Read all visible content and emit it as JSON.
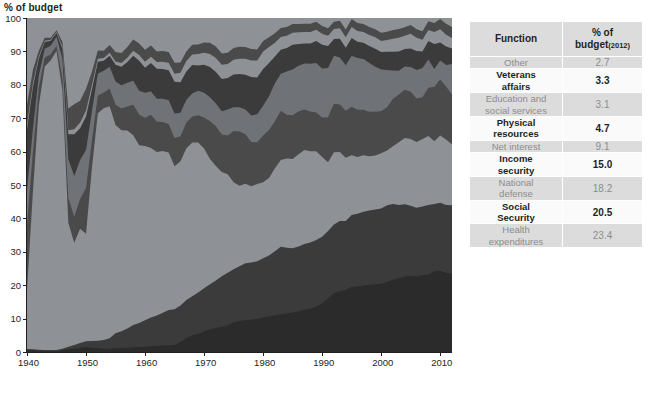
{
  "chart_data": {
    "type": "area",
    "stacked": true,
    "title": "",
    "ylabel": "% of budget",
    "xlabel": "",
    "ylim": [
      0,
      100
    ],
    "xlim": [
      1940,
      2012
    ],
    "grid": false,
    "legend": "table",
    "yticks": [
      0,
      10,
      20,
      30,
      40,
      50,
      60,
      70,
      80,
      90,
      100
    ],
    "xticks": [
      1940,
      1950,
      1960,
      1970,
      1980,
      1990,
      2000,
      2010
    ],
    "x": [
      1940,
      1941,
      1942,
      1943,
      1944,
      1945,
      1946,
      1947,
      1948,
      1949,
      1950,
      1951,
      1952,
      1953,
      1954,
      1955,
      1956,
      1957,
      1958,
      1959,
      1960,
      1961,
      1962,
      1963,
      1964,
      1965,
      1966,
      1967,
      1968,
      1969,
      1970,
      1971,
      1972,
      1973,
      1974,
      1975,
      1976,
      1977,
      1978,
      1979,
      1980,
      1981,
      1982,
      1983,
      1984,
      1985,
      1986,
      1987,
      1988,
      1989,
      1990,
      1991,
      1992,
      1993,
      1994,
      1995,
      1996,
      1997,
      1998,
      1999,
      2000,
      2001,
      2002,
      2003,
      2004,
      2005,
      2006,
      2007,
      2008,
      2009,
      2010,
      2011,
      2012
    ],
    "series": [
      {
        "name": "Health expenditures",
        "value_2012": 23.4,
        "color": "#2b2b2b",
        "values": [
          0.6,
          0.5,
          0.4,
          0.3,
          0.3,
          0.3,
          0.5,
          0.8,
          1.0,
          1.3,
          1.5,
          1.3,
          1.1,
          1.0,
          1.0,
          1.1,
          1.2,
          1.3,
          1.4,
          1.5,
          1.6,
          1.7,
          1.8,
          1.9,
          2.0,
          2.1,
          3.0,
          4.2,
          5.0,
          5.4,
          6.2,
          6.8,
          7.2,
          7.5,
          8.0,
          8.8,
          9.3,
          9.6,
          9.7,
          9.9,
          10.3,
          10.7,
          10.9,
          11.3,
          11.5,
          11.8,
          12.1,
          12.6,
          13.0,
          13.6,
          14.6,
          16.0,
          17.6,
          18.2,
          19.0,
          19.5,
          19.6,
          19.9,
          20.1,
          20.3,
          20.4,
          21.0,
          21.6,
          22.1,
          22.6,
          22.8,
          22.6,
          23.0,
          23.1,
          24.2,
          24.3,
          23.7,
          23.4
        ]
      },
      {
        "name": "Social Security",
        "value_2012": 20.5,
        "color": "#3b3b3b",
        "values": [
          0.3,
          0.3,
          0.3,
          0.3,
          0.3,
          0.3,
          0.5,
          0.8,
          1.1,
          1.4,
          1.7,
          2.0,
          2.3,
          2.6,
          3.1,
          4.5,
          5.0,
          5.7,
          6.7,
          7.2,
          7.9,
          8.6,
          9.1,
          9.7,
          10.3,
          10.7,
          10.9,
          11.4,
          11.7,
          12.4,
          12.9,
          13.5,
          14.2,
          15.2,
          15.7,
          16.0,
          16.4,
          17.0,
          17.1,
          17.3,
          17.8,
          18.2,
          19.3,
          20.2,
          19.7,
          19.3,
          19.5,
          19.7,
          19.8,
          19.9,
          19.9,
          20.2,
          20.6,
          21.0,
          21.0,
          21.5,
          21.8,
          22.1,
          22.3,
          22.4,
          22.6,
          22.9,
          22.7,
          21.9,
          21.6,
          21.0,
          20.6,
          20.6,
          20.9,
          20.1,
          20.4,
          20.3,
          20.5
        ]
      },
      {
        "name": "National defense",
        "value_2012": 18.2,
        "color": "#8e9196",
        "values": [
          17.5,
          47.1,
          73.0,
          84.9,
          86.7,
          89.5,
          77.3,
          37.1,
          30.6,
          34.2,
          32.2,
          51.8,
          68.1,
          69.4,
          69.5,
          62.4,
          60.2,
          59.3,
          56.8,
          53.2,
          52.2,
          50.8,
          49.0,
          48.0,
          46.2,
          42.8,
          43.2,
          45.4,
          46.0,
          44.9,
          41.8,
          37.5,
          34.3,
          31.2,
          29.5,
          26.0,
          24.1,
          23.8,
          22.8,
          23.1,
          22.7,
          23.2,
          24.8,
          26.0,
          26.7,
          26.7,
          27.6,
          28.1,
          27.3,
          26.6,
          23.9,
          20.6,
          21.6,
          20.7,
          19.3,
          17.9,
          17.0,
          16.9,
          16.2,
          16.1,
          16.5,
          16.4,
          17.3,
          18.8,
          19.9,
          20.0,
          19.7,
          20.2,
          20.7,
          18.8,
          20.1,
          19.6,
          18.2
        ]
      },
      {
        "name": "Income security",
        "value_2012": 15.0,
        "color": "#4a4a4a",
        "values": [
          19.6,
          11.9,
          5.4,
          2.7,
          1.8,
          1.6,
          3.5,
          7.5,
          7.8,
          8.9,
          13.7,
          8.3,
          5.2,
          4.7,
          5.2,
          6.0,
          6.5,
          7.2,
          9.1,
          9.2,
          8.4,
          9.9,
          9.0,
          8.6,
          8.4,
          8.5,
          7.5,
          7.7,
          7.8,
          8.2,
          9.3,
          11.3,
          11.9,
          11.2,
          11.6,
          15.4,
          16.2,
          14.8,
          13.3,
          12.5,
          14.0,
          14.4,
          14.1,
          14.7,
          13.1,
          13.1,
          12.8,
          12.1,
          11.9,
          11.6,
          11.8,
          13.5,
          14.5,
          14.2,
          14.4,
          14.5,
          14.1,
          13.6,
          13.3,
          13.1,
          12.6,
          13.0,
          14.2,
          14.3,
          14.4,
          14.1,
          13.0,
          12.5,
          14.4,
          16.3,
          16.8,
          15.9,
          15.0
        ]
      },
      {
        "name": "Net interest",
        "value_2012": 9.1,
        "color": "#6f7276",
        "values": [
          10.5,
          7.0,
          3.7,
          2.6,
          2.6,
          2.7,
          6.0,
          11.5,
          12.2,
          11.7,
          11.4,
          8.7,
          6.7,
          6.5,
          6.6,
          7.0,
          7.0,
          7.1,
          7.2,
          7.1,
          7.5,
          7.0,
          6.9,
          6.9,
          7.0,
          7.3,
          7.0,
          6.8,
          6.9,
          7.3,
          7.4,
          7.2,
          6.8,
          7.0,
          7.8,
          7.1,
          7.3,
          7.4,
          7.9,
          8.4,
          8.9,
          10.1,
          11.4,
          11.1,
          13.0,
          13.7,
          13.7,
          13.8,
          14.3,
          14.8,
          14.7,
          14.7,
          14.4,
          14.1,
          13.9,
          15.3,
          15.5,
          15.2,
          14.6,
          13.5,
          12.5,
          11.1,
          8.5,
          7.1,
          7.0,
          7.4,
          8.5,
          8.7,
          8.5,
          5.3,
          5.7,
          6.4,
          9.1
        ]
      },
      {
        "name": "Physical resources",
        "value_2012": 4.7,
        "color": "#3b3b3b",
        "values": [
          18.0,
          12.5,
          5.0,
          2.0,
          1.5,
          1.1,
          3.0,
          7.5,
          12.5,
          9.5,
          10.0,
          6.5,
          3.5,
          3.0,
          3.3,
          5.0,
          5.5,
          6.2,
          7.5,
          9.0,
          7.5,
          8.5,
          9.0,
          8.8,
          8.8,
          9.5,
          9.2,
          8.5,
          8.5,
          7.6,
          8.4,
          9.0,
          9.4,
          9.6,
          9.4,
          9.8,
          9.9,
          10.4,
          11.5,
          11.0,
          11.0,
          9.9,
          8.0,
          7.2,
          7.0,
          7.4,
          6.5,
          6.0,
          6.1,
          6.6,
          7.1,
          6.6,
          5.0,
          5.6,
          5.3,
          5.3,
          4.9,
          4.9,
          5.1,
          5.4,
          5.2,
          5.5,
          5.6,
          5.8,
          5.2,
          5.6,
          5.7,
          5.0,
          5.5,
          7.5,
          5.4,
          5.6,
          4.7
        ]
      },
      {
        "name": "Education and social services",
        "value_2012": 3.1,
        "color": "#8e9196",
        "values": [
          1.5,
          1.1,
          0.6,
          0.4,
          0.3,
          0.3,
          0.6,
          1.2,
          1.5,
          1.7,
          1.8,
          1.3,
          0.9,
          0.8,
          0.9,
          1.0,
          1.1,
          1.3,
          1.5,
          1.7,
          1.8,
          1.9,
          2.0,
          2.1,
          2.2,
          2.4,
          2.8,
          3.1,
          3.2,
          3.4,
          3.6,
          3.9,
          4.2,
          4.3,
          4.2,
          4.4,
          4.6,
          4.8,
          5.0,
          5.1,
          5.3,
          4.8,
          4.1,
          3.8,
          3.7,
          3.6,
          3.5,
          3.4,
          3.4,
          3.4,
          3.3,
          3.1,
          3.0,
          3.1,
          3.2,
          3.3,
          3.2,
          3.2,
          3.3,
          3.4,
          3.3,
          3.5,
          3.9,
          4.1,
          4.0,
          4.4,
          4.0,
          3.5,
          3.3,
          3.6,
          3.9,
          3.5,
          3.1
        ]
      },
      {
        "name": "Veterans affairs",
        "value_2012": 3.3,
        "color": "#4a4a4a",
        "values": [
          6.0,
          4.0,
          1.8,
          0.9,
          0.6,
          0.5,
          1.5,
          6.5,
          7.5,
          6.5,
          6.5,
          4.0,
          2.5,
          2.2,
          2.3,
          2.8,
          3.0,
          3.2,
          3.4,
          3.5,
          3.6,
          3.4,
          3.2,
          3.2,
          3.1,
          3.3,
          3.1,
          2.9,
          2.9,
          2.9,
          3.1,
          3.4,
          3.5,
          3.4,
          3.4,
          3.5,
          3.6,
          3.5,
          3.4,
          3.3,
          3.1,
          2.9,
          2.8,
          2.7,
          2.6,
          2.6,
          2.5,
          2.5,
          2.5,
          2.4,
          2.3,
          2.2,
          2.2,
          2.3,
          2.4,
          2.4,
          2.4,
          2.4,
          2.4,
          2.4,
          2.5,
          2.5,
          2.6,
          2.6,
          2.5,
          2.6,
          2.5,
          2.5,
          2.6,
          2.7,
          3.1,
          3.3,
          3.3
        ]
      },
      {
        "name": "Other",
        "value_2012": 2.7,
        "color": "#8e9196",
        "values": [
          26.0,
          15.6,
          9.8,
          5.9,
          5.9,
          3.7,
          7.1,
          27.1,
          25.8,
          24.8,
          21.2,
          16.1,
          9.7,
          9.8,
          8.1,
          10.2,
          10.5,
          8.7,
          6.4,
          7.6,
          9.5,
          8.2,
          10.0,
          9.8,
          10.0,
          13.4,
          13.3,
          10.0,
          8.0,
          7.9,
          7.3,
          7.4,
          8.5,
          10.6,
          10.4,
          9.0,
          8.6,
          8.7,
          9.3,
          9.4,
          6.9,
          5.8,
          4.6,
          3.0,
          2.7,
          1.8,
          1.8,
          1.7,
          1.7,
          1.1,
          2.4,
          3.1,
          1.1,
          0.8,
          3.5,
          0.3,
          1.5,
          1.8,
          2.7,
          3.4,
          4.4,
          4.1,
          3.6,
          3.3,
          2.8,
          2.1,
          3.4,
          4.0,
          1.0,
          1.5,
          0.3,
          1.7,
          2.7
        ]
      }
    ]
  },
  "table": {
    "header": {
      "function": "Function",
      "percent_line1": "% of",
      "percent_line2": "budget",
      "year": "(2012)"
    },
    "rows": [
      {
        "function": "Other",
        "percent": "2.7",
        "style": "shaded"
      },
      {
        "function": "Veterans\naffairs",
        "percent": "3.3",
        "style": "plain"
      },
      {
        "function": "Education and\nsocial services",
        "percent": "3.1",
        "style": "shaded"
      },
      {
        "function": "Physical\nresources",
        "percent": "4.7",
        "style": "plain"
      },
      {
        "function": "Net interest",
        "percent": "9.1",
        "style": "shaded"
      },
      {
        "function": "Income\nsecurity",
        "percent": "15.0",
        "style": "plain"
      },
      {
        "function": "National\ndefense",
        "percent": "18.2",
        "style": "shaded"
      },
      {
        "function": "Social\nSecurity",
        "percent": "20.5",
        "style": "plain"
      },
      {
        "function": "Health\nexpenditures",
        "percent": "23.4",
        "style": "shaded"
      }
    ]
  },
  "colors": {
    "text_dark": "#231f20",
    "text_muted": "#8c8c8c",
    "table_shaded_bg": "#dcdcdc",
    "table_plain_bg": "#fafafa",
    "axis": "#231f20"
  }
}
